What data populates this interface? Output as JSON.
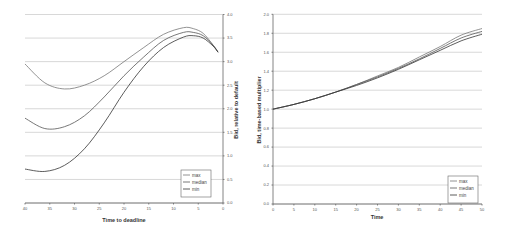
{
  "chart_data": [
    {
      "type": "line",
      "title": "",
      "xlabel": "Time to deadline",
      "ylabel": "Bid, relative to default",
      "xlim": [
        40,
        0
      ],
      "ylim": [
        0,
        4
      ],
      "x_reversed": true,
      "y_axis_side": "right",
      "grid": true,
      "legend_position": "bottom-right",
      "xticks": [
        "40",
        "35",
        "30",
        "25",
        "20",
        "15",
        "10",
        "5",
        "0"
      ],
      "yticks": [
        "0.0",
        "0.5",
        "1.0",
        "1.5",
        "2.0",
        "2.5",
        "3.0",
        "3.5",
        "4.0"
      ],
      "x": [
        40,
        36,
        32,
        28,
        24,
        20,
        16,
        12,
        8,
        6,
        4,
        2,
        1
      ],
      "series": [
        {
          "name": "max",
          "color": "#777777",
          "values": [
            2.95,
            2.55,
            2.42,
            2.5,
            2.7,
            3.0,
            3.3,
            3.58,
            3.72,
            3.7,
            3.6,
            3.35,
            3.2
          ]
        },
        {
          "name": "median",
          "color": "#555555",
          "values": [
            1.8,
            1.58,
            1.62,
            1.85,
            2.25,
            2.7,
            3.1,
            3.45,
            3.62,
            3.62,
            3.55,
            3.35,
            3.2
          ]
        },
        {
          "name": "min",
          "color": "#333333",
          "values": [
            0.72,
            0.67,
            0.8,
            1.15,
            1.7,
            2.35,
            2.9,
            3.3,
            3.52,
            3.55,
            3.5,
            3.33,
            3.2
          ]
        }
      ]
    },
    {
      "type": "line",
      "title": "",
      "xlabel": "Time",
      "ylabel": "Bid, time-based multiplier",
      "xlim": [
        0,
        50
      ],
      "ylim": [
        0,
        2
      ],
      "y_axis_side": "left",
      "grid": true,
      "legend_position": "bottom-right",
      "xticks": [
        "0",
        "5",
        "10",
        "15",
        "20",
        "25",
        "30",
        "35",
        "40",
        "45",
        "50"
      ],
      "yticks": [
        "0.0",
        "0.2",
        "0.4",
        "0.6",
        "0.8",
        "1.0",
        "1.2",
        "1.4",
        "1.6",
        "1.8",
        "2.0"
      ],
      "x": [
        0,
        5,
        10,
        15,
        20,
        25,
        30,
        35,
        40,
        45,
        50
      ],
      "series": [
        {
          "name": "max",
          "color": "#777777",
          "values": [
            1.0,
            1.05,
            1.11,
            1.18,
            1.26,
            1.35,
            1.44,
            1.55,
            1.66,
            1.78,
            1.85
          ]
        },
        {
          "name": "median",
          "color": "#555555",
          "values": [
            1.0,
            1.05,
            1.11,
            1.18,
            1.26,
            1.34,
            1.43,
            1.53,
            1.64,
            1.75,
            1.82
          ]
        },
        {
          "name": "min",
          "color": "#333333",
          "values": [
            1.0,
            1.05,
            1.11,
            1.18,
            1.25,
            1.33,
            1.42,
            1.52,
            1.62,
            1.72,
            1.79
          ]
        }
      ]
    }
  ]
}
